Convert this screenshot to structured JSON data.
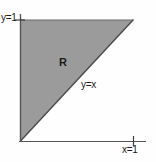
{
  "figure": {
    "type": "math-region-diagram",
    "background_color": "#fefefe",
    "region": {
      "label": "R",
      "fill_color": "#9b9b9b",
      "outline_color": "#4d4d4d",
      "vertices": [
        {
          "x": 0,
          "y": 0
        },
        {
          "x": 0,
          "y": 1
        },
        {
          "x": 1,
          "y": 1
        }
      ]
    },
    "axes": {
      "color": "#555555",
      "x_axis_label": "x=1",
      "y_axis_label": "y=1",
      "x_tick_value": 1,
      "y_tick_value": 1
    },
    "curves": [
      {
        "label": "y=x",
        "equation": "y=x",
        "color": "#4d4d4d"
      }
    ]
  }
}
